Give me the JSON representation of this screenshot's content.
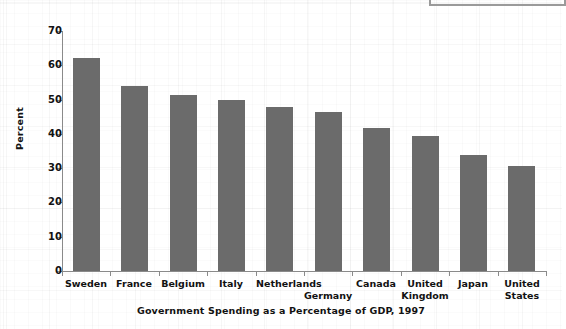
{
  "chart_data": {
    "type": "bar",
    "title": "",
    "caption": "Government Spending as a Percentage of GDP, 1997",
    "xlabel": "",
    "ylabel": "Percent",
    "ylim": [
      0,
      70
    ],
    "ytick_interval": 10,
    "yticks": [
      "70",
      "60",
      "50",
      "40",
      "30",
      "20",
      "10",
      "0"
    ],
    "grid": false,
    "legend": null,
    "bar_color": "#6b6b6b",
    "axis_color": "#8a8a8a",
    "text_color": "#121212",
    "categories": [
      "Sweden",
      "France",
      "Belgium",
      "Italy",
      "Netherlands",
      "Germany",
      "Canada",
      "United Kingdom",
      "Japan",
      "United States"
    ],
    "category_lines": [
      [
        "Sweden",
        ""
      ],
      [
        "France",
        ""
      ],
      [
        "Belgium",
        ""
      ],
      [
        "Italy",
        ""
      ],
      [
        "Netherlands",
        ""
      ],
      [
        "",
        "Germany"
      ],
      [
        "Canada",
        ""
      ],
      [
        "United",
        "Kingdom"
      ],
      [
        "Japan",
        ""
      ],
      [
        "United",
        "States"
      ]
    ],
    "values": [
      62.0,
      54.0,
      51.2,
      50.0,
      47.7,
      46.5,
      41.6,
      39.5,
      33.8,
      30.7
    ]
  }
}
